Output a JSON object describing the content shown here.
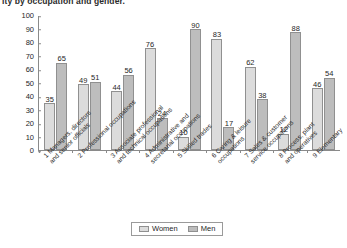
{
  "chart_data": {
    "type": "bar",
    "title": "ity by occupation and gender.",
    "xlabel": "",
    "ylabel": "",
    "ylim": [
      0,
      100
    ],
    "yticks": [
      100,
      90,
      80,
      70,
      60,
      50,
      40,
      30,
      20,
      10,
      0
    ],
    "grid": false,
    "legend_position": "bottom-center",
    "categories": [
      "1 Managers, directors\nand senior officials",
      "2 Professional occupations",
      "3 Associate professional\nand technical occupations",
      "4 Administrative and\nsecretarial occupations",
      "5 Skilled trades",
      "6 Caring & leisure\noccupations",
      "7 Sales & customer\nservice occupations",
      "8 Process, plant\nand operatives",
      "9 Elementary"
    ],
    "series": [
      {
        "name": "Women",
        "color": "#dcdcdc",
        "values": [
          35,
          49,
          44,
          76,
          10,
          83,
          62,
          12,
          46
        ]
      },
      {
        "name": "Men",
        "color": "#bdbdbd",
        "values": [
          65,
          51,
          56,
          24,
          90,
          17,
          38,
          88,
          54
        ]
      }
    ]
  },
  "legend": {
    "items": [
      {
        "label": "Women",
        "color": "#dcdcdc"
      },
      {
        "label": "Men",
        "color": "#bdbdbd"
      }
    ]
  }
}
